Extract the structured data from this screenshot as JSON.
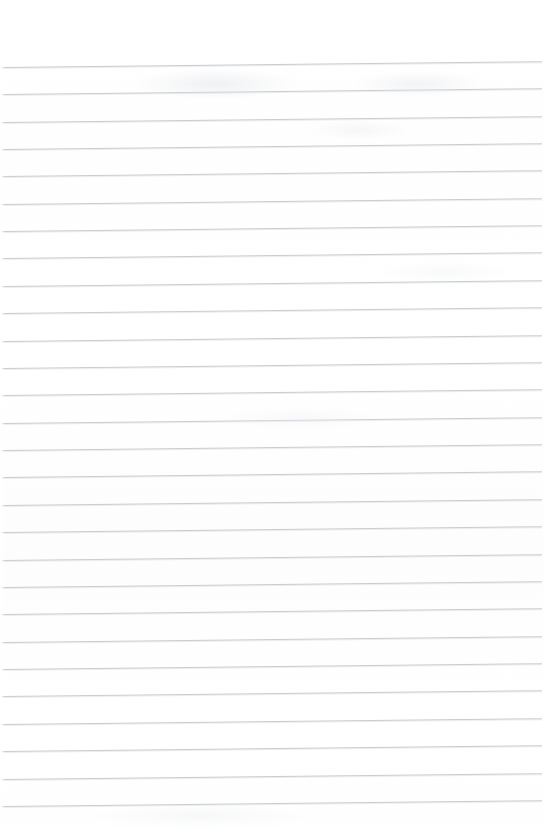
{
  "document": {
    "kind": "scanned-ruled-paper",
    "title": "Blank ruled notebook page",
    "page_width": 546,
    "page_height": 829,
    "background_color": "#ffffff",
    "has_visible_text": false,
    "has_margin_rule": false,
    "has_header": false,
    "has_footer": false,
    "has_page_number": false,
    "orientation": "portrait"
  },
  "ruling": {
    "line_color": "#c9ccd1",
    "line_thickness_px": 1,
    "line_count": 28,
    "first_line_y": 67,
    "line_spacing_px": 27.4,
    "left_inset_px": 2,
    "right_inset_px": 4,
    "skew_degrees": -0.62,
    "top_margin_px": 67,
    "bottom_margin_px": 23
  },
  "lines": [
    {
      "index": 1,
      "y": 67,
      "text": ""
    },
    {
      "index": 2,
      "y": 94,
      "text": ""
    },
    {
      "index": 3,
      "y": 122,
      "text": ""
    },
    {
      "index": 4,
      "y": 149,
      "text": ""
    },
    {
      "index": 5,
      "y": 176,
      "text": ""
    },
    {
      "index": 6,
      "y": 204,
      "text": ""
    },
    {
      "index": 7,
      "y": 231,
      "text": ""
    },
    {
      "index": 8,
      "y": 258,
      "text": ""
    },
    {
      "index": 9,
      "y": 286,
      "text": ""
    },
    {
      "index": 10,
      "y": 313,
      "text": ""
    },
    {
      "index": 11,
      "y": 341,
      "text": ""
    },
    {
      "index": 12,
      "y": 368,
      "text": ""
    },
    {
      "index": 13,
      "y": 395,
      "text": ""
    },
    {
      "index": 14,
      "y": 423,
      "text": ""
    },
    {
      "index": 15,
      "y": 450,
      "text": ""
    },
    {
      "index": 16,
      "y": 477,
      "text": ""
    },
    {
      "index": 17,
      "y": 505,
      "text": ""
    },
    {
      "index": 18,
      "y": 532,
      "text": ""
    },
    {
      "index": 19,
      "y": 560,
      "text": ""
    },
    {
      "index": 20,
      "y": 587,
      "text": ""
    },
    {
      "index": 21,
      "y": 614,
      "text": ""
    },
    {
      "index": 22,
      "y": 642,
      "text": ""
    },
    {
      "index": 23,
      "y": 669,
      "text": ""
    },
    {
      "index": 24,
      "y": 696,
      "text": ""
    },
    {
      "index": 25,
      "y": 724,
      "text": ""
    },
    {
      "index": 26,
      "y": 751,
      "text": ""
    },
    {
      "index": 27,
      "y": 779,
      "text": ""
    },
    {
      "index": 28,
      "y": 806,
      "text": ""
    }
  ]
}
